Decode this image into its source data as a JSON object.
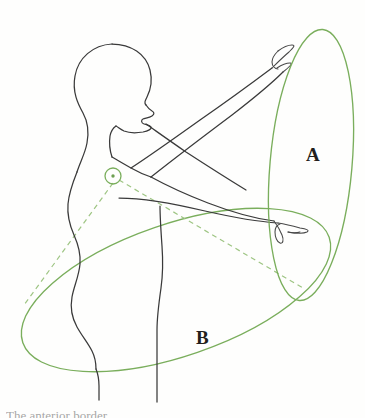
{
  "figure": {
    "kind": "anatomical-line-diagram",
    "background_color": "#fefefd",
    "ink_color": "#3a3a3a",
    "accent_color": "#7aae5c",
    "dashed_color": "#9ec583",
    "width": 365,
    "height": 418
  },
  "labels": {
    "plane_a": "A",
    "plane_b": "B"
  },
  "caption": {
    "cropped_text": "The anterior border"
  },
  "joint_marker": {
    "name": "shoulder-joint-center",
    "cx": 113,
    "cy": 176,
    "r": 8
  },
  "ellipse_a": {
    "name": "motion-plane-a",
    "cx": 311,
    "cy": 165,
    "rx": 41,
    "ry": 136,
    "rotation_deg": 5
  },
  "ellipse_b": {
    "name": "motion-plane-b",
    "cx": 176,
    "cy": 290,
    "rx": 162,
    "ry": 66,
    "rotation_deg": -19
  },
  "radii_lines": [
    {
      "name": "radius-to-lower-left",
      "x1": 113,
      "y1": 183,
      "x2": 24,
      "y2": 305
    },
    {
      "name": "radius-to-lower-right",
      "x1": 119,
      "y1": 180,
      "x2": 303,
      "y2": 288
    }
  ]
}
